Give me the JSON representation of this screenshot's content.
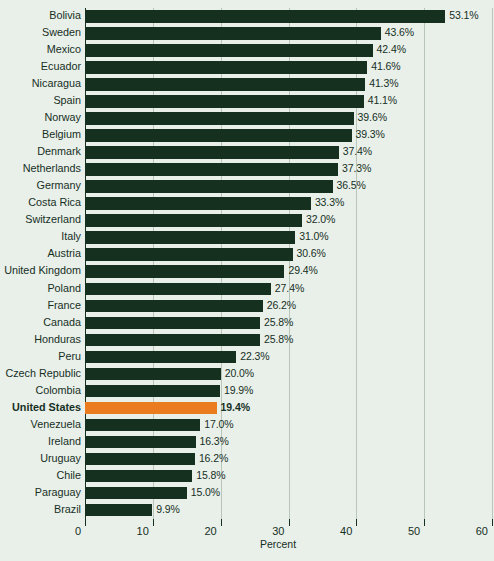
{
  "chart_data": {
    "type": "bar",
    "orientation": "horizontal",
    "title": "",
    "subtitle": "",
    "xlabel": "Percent",
    "ylabel": "",
    "xlim": [
      0,
      60
    ],
    "xticks": [
      0,
      10,
      20,
      30,
      40,
      50,
      60
    ],
    "xtick_labels": [
      "0",
      "10",
      "20",
      "30",
      "40",
      "50",
      "60"
    ],
    "grid": true,
    "grid_axis": "x",
    "legend": false,
    "legend_position": "none",
    "value_label_suffix": "%",
    "categories": [
      "Bolivia",
      "Sweden",
      "Mexico",
      "Ecuador",
      "Nicaragua",
      "Spain",
      "Norway",
      "Belgium",
      "Denmark",
      "Netherlands",
      "Germany",
      "Costa Rica",
      "Switzerland",
      "Italy",
      "Austria",
      "United Kingdom",
      "Poland",
      "France",
      "Canada",
      "Honduras",
      "Peru",
      "Czech Republic",
      "Colombia",
      "United States",
      "Venezuela",
      "Ireland",
      "Uruguay",
      "Chile",
      "Paraguay",
      "Brazil"
    ],
    "values": [
      53.1,
      43.6,
      42.4,
      41.6,
      41.3,
      41.1,
      39.6,
      39.3,
      37.4,
      37.3,
      36.5,
      33.3,
      32.0,
      31.0,
      30.6,
      29.4,
      27.4,
      26.2,
      25.8,
      25.8,
      22.3,
      20.0,
      19.9,
      19.4,
      17.0,
      16.3,
      16.2,
      15.8,
      15.0,
      9.9
    ],
    "value_labels": [
      "53.1%",
      "43.6%",
      "42.4%",
      "41.6%",
      "41.3%",
      "41.1%",
      "39.6%",
      "39.3%",
      "37.4%",
      "37.3%",
      "36.5%",
      "33.3%",
      "32.0%",
      "31.0%",
      "30.6%",
      "29.4%",
      "27.4%",
      "26.2%",
      "25.8%",
      "25.8%",
      "22.3%",
      "20.0%",
      "19.9%",
      "19.4%",
      "17.0%",
      "16.3%",
      "16.2%",
      "15.8%",
      "15.0%",
      "9.9%"
    ],
    "highlighted_category": "United States",
    "highlight_index": 23,
    "colors": {
      "bar": "#16301f",
      "highlight_bar": "#ea7b1e",
      "background": "#e9efe9",
      "gridline": "#b9c5b9",
      "text": "#16301f"
    }
  }
}
